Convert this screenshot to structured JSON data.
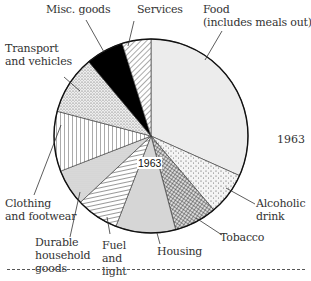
{
  "chart_data": {
    "type": "pie",
    "title": "1963",
    "center_label": "1963",
    "side_label": "1963",
    "start_angle_deg": 0,
    "direction": "clockwise",
    "unit": "percent of household expenditure (estimated)",
    "categories": [
      "Food (includes meals out)",
      "Alcoholic drink",
      "Tobacco",
      "Housing",
      "Fuel and light",
      "Durable household goods",
      "Clothing and footwear",
      "Transport and vehicles",
      "Misc. goods",
      "Services"
    ],
    "values": [
      31.7,
      7.1,
      7.1,
      10.0,
      7.1,
      6.1,
      10.0,
      9.8,
      6.3,
      4.8
    ],
    "fills": [
      "light-grey",
      "dots-sparse",
      "crosshatch",
      "mid-grey",
      "horizontal-lines",
      "fine-dots",
      "vertical-lines",
      "dots-dense",
      "black",
      "diagonal-lines"
    ]
  },
  "labels": {
    "food": "Food\n(includes meals out)",
    "alcohol": "Alcoholic\ndrink",
    "tobacco": "Tobacco",
    "housing": "Housing",
    "fuel": "Fuel\nand\nlight",
    "durable": "Durable\nhousehold\ngoods",
    "clothing": "Clothing\nand footwear",
    "transport": "Transport\nand vehicles",
    "misc": "Misc. goods",
    "services": "Services",
    "center": "1963",
    "year": "1963"
  },
  "colors": {
    "food": "#ececec",
    "housing": "#d6d6d6",
    "misc": "#000000",
    "stroke": "#222222"
  }
}
